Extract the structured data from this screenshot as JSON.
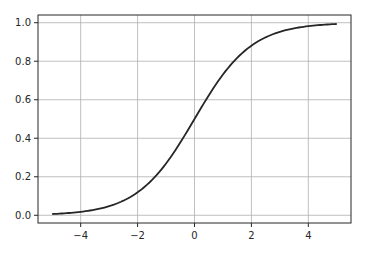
{
  "chart_data": {
    "type": "line",
    "title": "",
    "xlabel": "",
    "ylabel": "",
    "xlim": [
      -5.5,
      5.5
    ],
    "ylim": [
      -0.04,
      1.04
    ],
    "grid": true,
    "legend": null,
    "x_ticks": [
      -4,
      -2,
      0,
      2,
      4
    ],
    "x_tick_labels": [
      "−4",
      "−2",
      "0",
      "2",
      "4"
    ],
    "y_ticks": [
      0.0,
      0.2,
      0.4,
      0.6,
      0.8,
      1.0
    ],
    "y_tick_labels": [
      "0.0",
      "0.2",
      "0.4",
      "0.6",
      "0.8",
      "1.0"
    ],
    "series": [
      {
        "name": "sigmoid",
        "color": "#262626",
        "function": "1/(1+exp(-x))",
        "x": [
          -5,
          -4,
          -3,
          -2,
          -1,
          0,
          1,
          2,
          3,
          4,
          5
        ],
        "values": [
          0.0067,
          0.018,
          0.047,
          0.119,
          0.269,
          0.5,
          0.731,
          0.881,
          0.953,
          0.982,
          0.9933
        ]
      }
    ]
  },
  "colors": {
    "axes_edge": "#262626",
    "grid": "#b0b0b0",
    "line": "#262626",
    "background": "#ffffff"
  }
}
